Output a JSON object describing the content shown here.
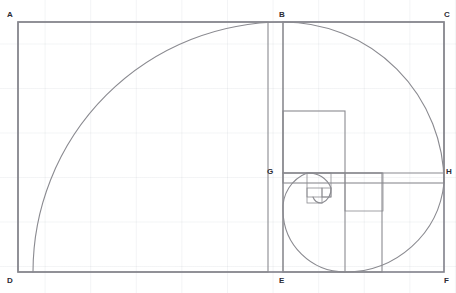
{
  "figure": {
    "type": "geometric-diagram",
    "canvas": {
      "width": 456,
      "height": 293
    },
    "background": {
      "color": "#ffffff",
      "grid": "graph-paper",
      "grid_color": "#dfe3ea",
      "grid_spacing_x": 45.6,
      "grid_spacing_y": 44.5
    },
    "stroke": {
      "color": "#8a8a90",
      "outer_color": "#80808a",
      "width": 1.1,
      "outer_width": 1.6,
      "inner_width": 0.8
    },
    "outer_rectangle": {
      "label": "ADFC",
      "x": 18,
      "y": 22,
      "width": 426,
      "height": 250
    },
    "points": [
      {
        "id": "A",
        "label": "A",
        "x": 18,
        "y": 22,
        "label_x": 7,
        "label_y": 11
      },
      {
        "id": "B",
        "label": "B",
        "x": 283,
        "y": 22,
        "label_x": 279,
        "label_y": 11
      },
      {
        "id": "C",
        "label": "C",
        "x": 444,
        "y": 22,
        "label_x": 444,
        "label_y": 11
      },
      {
        "id": "D",
        "label": "D",
        "x": 18,
        "y": 272,
        "label_x": 7,
        "label_y": 277
      },
      {
        "id": "E",
        "label": "E",
        "x": 283,
        "y": 272,
        "label_x": 279,
        "label_y": 277
      },
      {
        "id": "F",
        "label": "F",
        "x": 444,
        "y": 272,
        "label_x": 444,
        "label_y": 277
      },
      {
        "id": "G",
        "label": "G",
        "x": 283,
        "y": 173,
        "label_x": 267,
        "label_y": 168
      },
      {
        "id": "H",
        "label": "H",
        "x": 444,
        "y": 173,
        "label_x": 446,
        "label_y": 168
      }
    ],
    "squares": [
      {
        "name": "square-ABED",
        "x": 18,
        "y": 22,
        "size": 250
      },
      {
        "name": "square-BCHG",
        "x": 283,
        "y": 22,
        "size": 161
      },
      {
        "name": "square-GHFE",
        "x": 283,
        "y": 173,
        "size": 99
      },
      {
        "name": "square-4",
        "x": 283,
        "y": 111,
        "size": 62
      },
      {
        "name": "square-5",
        "x": 345,
        "y": 173,
        "size": 38
      },
      {
        "name": "square-6",
        "x": 307,
        "y": 173,
        "size": 24
      },
      {
        "name": "square-7",
        "x": 307,
        "y": 188,
        "size": 15
      },
      {
        "name": "square-8",
        "x": 322,
        "y": 188,
        "size": 9
      }
    ],
    "internal_lines": [
      {
        "name": "line-BE",
        "x1": 283,
        "y1": 22,
        "x2": 283,
        "y2": 272
      },
      {
        "name": "line-GH",
        "x1": 283,
        "y1": 173,
        "x2": 444,
        "y2": 173
      },
      {
        "name": "line-EF-divider",
        "x1": 345,
        "y1": 173,
        "x2": 345,
        "y2": 272
      }
    ],
    "spiral": {
      "name": "golden-spiral",
      "description": "Quarter-circle arcs inscribed in each successive square",
      "arcs": [
        {
          "cx": 283,
          "cy": 272,
          "r": 250,
          "start_deg": 180,
          "sweep_deg": -90
        },
        {
          "cx": 283,
          "cy": 183,
          "r": 161,
          "start_deg": 90,
          "sweep_deg": -90
        },
        {
          "cx": 345,
          "cy": 173,
          "r": 99,
          "start_deg": 0,
          "sweep_deg": -90
        },
        {
          "cx": 345,
          "cy": 211,
          "r": 62,
          "start_deg": 270,
          "sweep_deg": -90
        },
        {
          "cx": 307,
          "cy": 211,
          "r": 38,
          "start_deg": 180,
          "sweep_deg": -90
        },
        {
          "cx": 307,
          "cy": 188,
          "r": 24,
          "start_deg": 90,
          "sweep_deg": -90
        },
        {
          "cx": 322,
          "cy": 188,
          "r": 15,
          "start_deg": 0,
          "sweep_deg": -90
        },
        {
          "cx": 322,
          "cy": 197,
          "r": 9,
          "start_deg": 270,
          "sweep_deg": -90
        }
      ]
    }
  },
  "chart_data": {
    "type": "diagram",
    "xlabel": "",
    "ylabel": "",
    "categories": [
      "A",
      "B",
      "C",
      "D",
      "E",
      "F",
      "G",
      "H"
    ],
    "values": [
      250,
      161,
      99,
      62,
      38,
      24,
      15,
      9
    ]
  }
}
